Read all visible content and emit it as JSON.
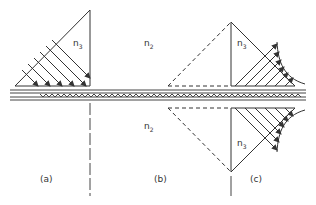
{
  "figure": {
    "labels": {
      "n3_a": "n",
      "n3_a_sub": "3",
      "n2_top": "n",
      "n2_top_sub": "2",
      "n2_bottom": "n",
      "n2_bottom_sub": "2",
      "n3_c_top": "n",
      "n3_c_top_sub": "3",
      "n3_c_bottom": "n",
      "n3_c_bottom_sub": "3",
      "panel_a": "(a)",
      "panel_b": "(b)",
      "panel_c": "(c)"
    },
    "colors": {
      "ink": "#333333",
      "background": "#ffffff"
    }
  }
}
